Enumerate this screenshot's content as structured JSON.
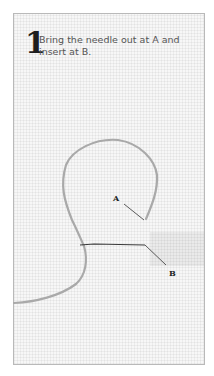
{
  "instruction": {
    "step_number": "1",
    "text": "Bring the needle out at A and insert at B."
  },
  "diagram": {
    "labels": {
      "a": "A",
      "b": "B"
    },
    "colors": {
      "thread": "#a9a9a9",
      "needle_thread": "#3a3a3a",
      "frame_border": "#b9b9b9",
      "fabric": "#f7f7f7"
    }
  }
}
